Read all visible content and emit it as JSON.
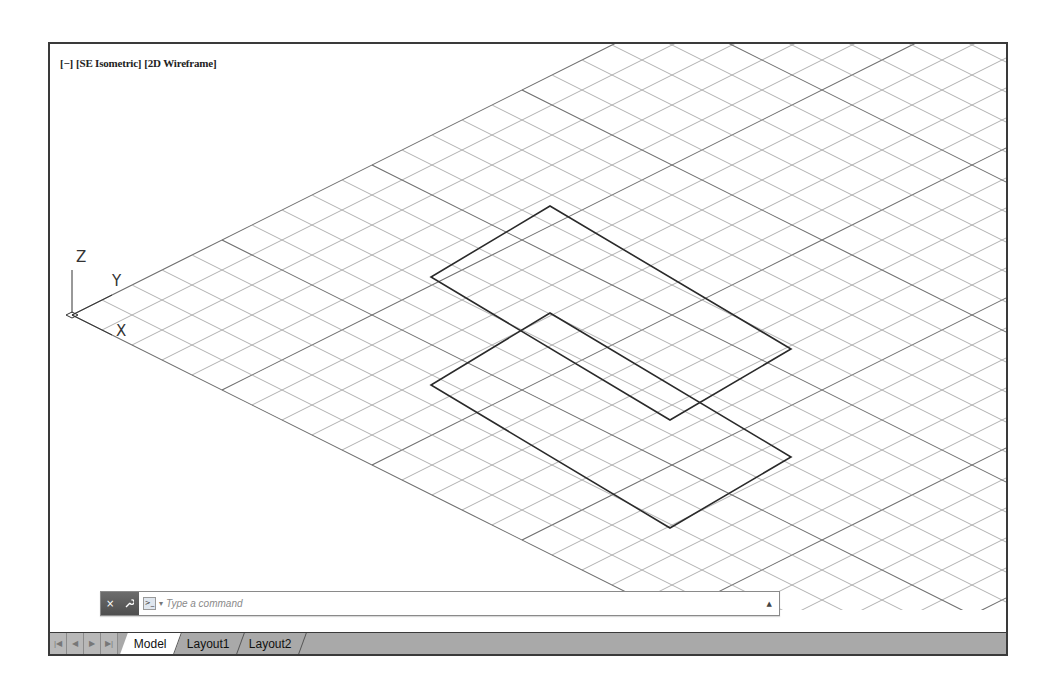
{
  "viewport": {
    "controls_label": "[−]",
    "view_label": "[SE Isometric]",
    "visual_style_label": "[2D Wireframe]",
    "ucs_icon": {
      "z_label": "Z",
      "y_label": "Y",
      "x_label": "X"
    },
    "grid": {
      "origin": [
        22,
        271
      ],
      "step_x": 30,
      "major_every": 5,
      "line_color": "#a8a8a8",
      "major_color": "#6e6e6e"
    },
    "shapes": [
      {
        "name": "upper-rectangle",
        "points": [
          [
            500,
            162
          ],
          [
            381,
            233
          ],
          [
            620,
            376
          ],
          [
            741,
            305
          ]
        ]
      },
      {
        "name": "lower-rectangle",
        "points": [
          [
            500,
            269
          ],
          [
            381,
            341
          ],
          [
            620,
            484
          ],
          [
            741,
            413
          ]
        ]
      }
    ]
  },
  "command_line": {
    "close_icon": "×",
    "customize_icon": "wrench",
    "prompt_icon": ">_",
    "placeholder": "Type a command",
    "value": "",
    "history_icon": "▲"
  },
  "layout_tabs": {
    "nav_buttons": [
      "first",
      "previous",
      "next",
      "last"
    ],
    "nav_glyphs": [
      "|◀",
      "◀",
      "▶",
      "▶|"
    ],
    "tabs": [
      {
        "label": "Model",
        "active": true
      },
      {
        "label": "Layout1",
        "active": false
      },
      {
        "label": "Layout2",
        "active": false
      }
    ]
  }
}
